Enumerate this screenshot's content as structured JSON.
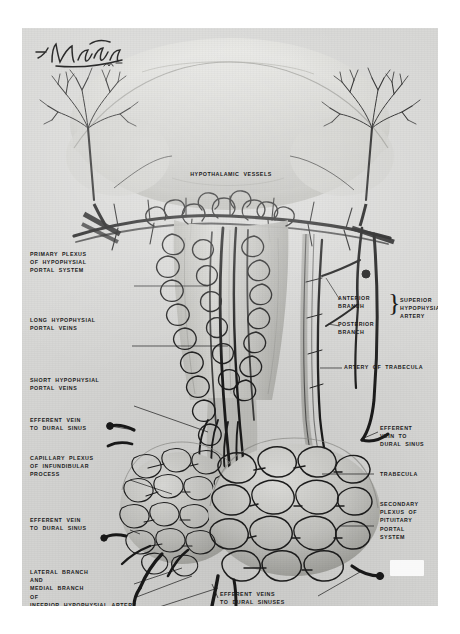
{
  "plate": {
    "title": "Blood Supply of the Hypophysis (Pituitary Gland)",
    "artist_signature": "F. Netter M.D.",
    "medium": "grayscale anatomical illustration",
    "paper_color": "#d8d8d6",
    "ink_color": "#1b1b1b"
  },
  "labels": {
    "hypothalamic_vessels": "HYPOTHALAMIC  VESSELS",
    "primary_plexus": "PRIMARY  PLEXUS\nOF  HYPOPHYSIAL\nPORTAL  SYSTEM",
    "long_portal_veins": "LONG  HYPOPHYSIAL\nPORTAL  VEINS",
    "short_portal_veins": "SHORT  HYPOPHYSIAL\nPORTAL  VEINS",
    "efferent_vein_left_upper": "EFFERENT  VEIN\nTO  DURAL  SINUS",
    "capillary_plexus": "CAPILLARY  PLEXUS\nOF  INFUNDIBULAR\nPROCESS",
    "efferent_vein_left_lower": "EFFERENT  VEIN\nTO  DURAL  SINUS",
    "inferior_hypophysial": "LATERAL  BRANCH\nAND\nMEDIAL  BRANCH\nOF\nINFERIOR  HYPOPHYSIAL  ARTERY",
    "anterior_branch": "ANTERIOR\nBRANCH",
    "posterior_branch": "POSTERIOR\nBRANCH",
    "superior_hypophysial_artery": "SUPERIOR\nHYPOPHYSIAL\nARTERY",
    "artery_of_trabecula": "ARTERY  OF  TRABECULA",
    "efferent_vein_right": "EFFERENT\nVEIN  TO\nDURAL  SINUS",
    "trabecula": "TRABECULA",
    "secondary_plexus": "SECONDARY\nPLEXUS  OF\nPITUITARY\nPORTAL\nSYSTEM",
    "efferent_veins_bottom": "EFFERENT  VEINS\nTO  DURAL  SINUSES"
  },
  "structures": {
    "hypothalamus": "hypothalamus-region",
    "infundibular_stem": "infundibular-stem",
    "pars_distalis": "pars-distalis",
    "pars_nervosa": "pars-nervosa",
    "left_lobe_plexus": "left-lobe-capillary-plexus",
    "right_lobe_plexus": "right-lobe-sinusoid-plexus"
  },
  "brace_glyph": "}"
}
